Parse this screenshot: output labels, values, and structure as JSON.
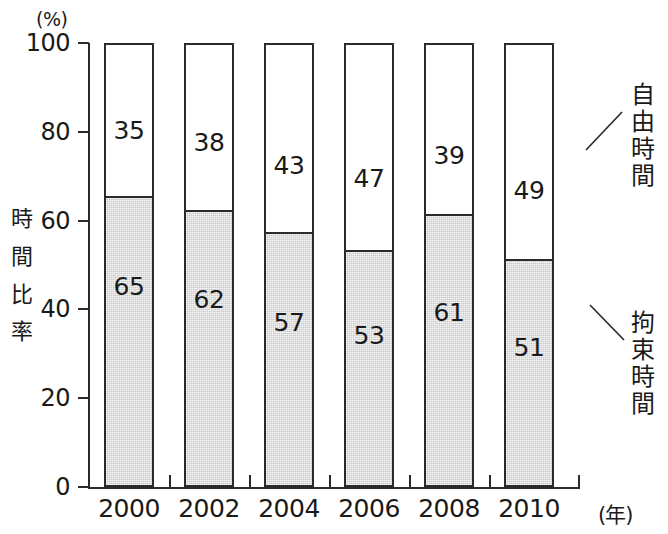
{
  "chart_data": {
    "type": "bar",
    "subtype": "stacked-100-percent",
    "title": "",
    "xlabel": "(年)",
    "ylabel": "時間比率",
    "yunit": "(%)",
    "ylim": [
      0,
      100
    ],
    "ytick_values": [
      100,
      80,
      60,
      40,
      20,
      0
    ],
    "ytick_labels": [
      "100",
      "80",
      "60",
      "40",
      "20",
      "0"
    ],
    "grid": false,
    "legend_position": "right-callout",
    "categories": [
      "2000",
      "2002",
      "2004",
      "2006",
      "2008",
      "2010"
    ],
    "series": [
      {
        "name": "自由時間",
        "color": "#ffffff",
        "values": [
          35,
          38,
          43,
          47,
          39,
          49
        ],
        "labels": [
          "35",
          "38",
          "43",
          "47",
          "39",
          "49"
        ]
      },
      {
        "name": "拘束時間",
        "color": "#c9c9c9",
        "values": [
          65,
          62,
          57,
          53,
          61,
          51
        ],
        "labels": [
          "65",
          "62",
          "57",
          "53",
          "61",
          "51"
        ]
      }
    ],
    "annotations": [
      {
        "text": "自由時間",
        "chars": [
          "自",
          "由",
          "時",
          "間"
        ],
        "target_series": "自由時間"
      },
      {
        "text": "拘束時間",
        "chars": [
          "拘",
          "束",
          "時",
          "間"
        ],
        "target_series": "拘束時間"
      }
    ]
  },
  "axis": {
    "unit_label": "(%)",
    "x_unit_label": "(年)",
    "y_title_chars": [
      "時",
      "間",
      "比",
      "率"
    ]
  },
  "colors": {
    "axis": "#2b2b2b",
    "fill_gray": "#c9c9c9",
    "fill_white": "#ffffff",
    "text": "#1a1a1a"
  }
}
